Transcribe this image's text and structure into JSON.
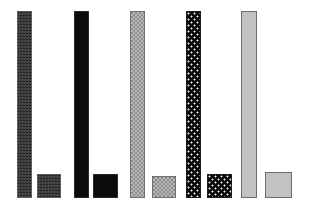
{
  "figure": {
    "title": "",
    "background_color": "#ffffff",
    "width": 309,
    "height": 216
  },
  "chart_data": {
    "type": "bar",
    "title": "",
    "subtitle": "",
    "xlabel": "",
    "ylabel": "",
    "xlim": [
      0,
      309
    ],
    "ylim": [
      0,
      216
    ],
    "grid": false,
    "legend_position": "none",
    "axis_visible": false,
    "tick_labels_x": [],
    "tick_labels_y": [],
    "annotations": [],
    "categories": [
      "1",
      "2",
      "3",
      "4",
      "5"
    ],
    "series": [
      {
        "name": "tall-bar",
        "values": [
          187,
          187,
          187,
          187,
          187
        ]
      },
      {
        "name": "square-bar",
        "values": [
          24,
          24,
          24,
          24,
          24
        ]
      }
    ],
    "patterns": [
      {
        "index": 1,
        "name": "fine-noise-dark",
        "fill_color": "#3b3b3b",
        "accent_color": "#585858",
        "border_color": "#5c5c5c"
      },
      {
        "index": 2,
        "name": "solid-black",
        "fill_color": "#0b0b0b",
        "accent_color": "#0b0b0b",
        "border_color": "#2a2a2a"
      },
      {
        "index": 3,
        "name": "checkerboard-grey",
        "fill_color": "#8e8e8e",
        "accent_color": "#b8b8b8",
        "border_color": "#6f6f6f"
      },
      {
        "index": 4,
        "name": "dots-white-on-black",
        "fill_color": "#090909",
        "accent_color": "#f2f2f2",
        "border_color": "#1c1c1c"
      },
      {
        "index": 5,
        "name": "solid-light-grey",
        "fill_color": "#c2c2c2",
        "accent_color": "#c2c2c2",
        "border_color": "#6d6d6d"
      }
    ]
  },
  "bars": {
    "tall": [
      {
        "label": "tall-bar-1",
        "x": 17,
        "y": 11,
        "w": 15,
        "h": 187,
        "pattern": "fine-noise-dark"
      },
      {
        "label": "tall-bar-2",
        "x": 74,
        "y": 11,
        "w": 15,
        "h": 187,
        "pattern": "solid-black"
      },
      {
        "label": "tall-bar-3",
        "x": 130,
        "y": 11,
        "w": 15,
        "h": 187,
        "pattern": "checkerboard-grey"
      },
      {
        "label": "tall-bar-4",
        "x": 186,
        "y": 11,
        "w": 15,
        "h": 187,
        "pattern": "dots-white-on-black"
      },
      {
        "label": "tall-bar-5",
        "x": 241,
        "y": 11,
        "w": 16,
        "h": 187,
        "pattern": "solid-light-grey"
      }
    ],
    "square": [
      {
        "label": "square-bar-1",
        "x": 37,
        "y": 174,
        "w": 24,
        "h": 24,
        "pattern": "fine-noise-dark"
      },
      {
        "label": "square-bar-2",
        "x": 93,
        "y": 174,
        "w": 25,
        "h": 24,
        "pattern": "solid-black"
      },
      {
        "label": "square-bar-3",
        "x": 152,
        "y": 176,
        "w": 24,
        "h": 22,
        "pattern": "checkerboard-grey"
      },
      {
        "label": "square-bar-4",
        "x": 207,
        "y": 174,
        "w": 25,
        "h": 24,
        "pattern": "dots-white-on-black"
      },
      {
        "label": "square-bar-5",
        "x": 265,
        "y": 172,
        "w": 27,
        "h": 26,
        "pattern": "solid-light-grey"
      }
    ]
  }
}
